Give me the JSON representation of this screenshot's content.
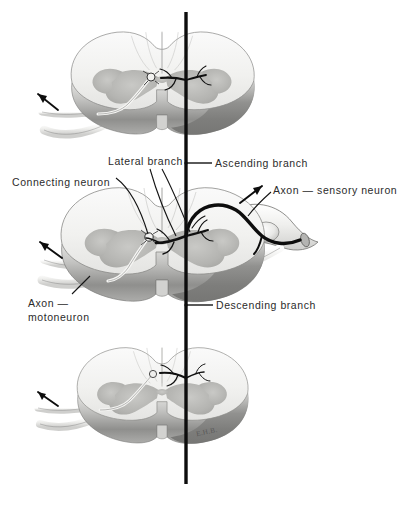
{
  "figure": {
    "width": 404,
    "height": 507,
    "background": "#ffffff",
    "signature": "E.H.B."
  },
  "labels": {
    "connecting_neuron": "Connecting neuron",
    "lateral_branch": "Lateral branch",
    "ascending_branch": "Ascending branch",
    "axon_sensory_neuron": "Axon — sensory neuron",
    "axon_motoneuron_line1": "Axon —",
    "axon_motoneuron_line2": "motoneuron",
    "descending_branch": "Descending branch"
  },
  "colors": {
    "ink": "#2b2b2b",
    "axon_black": "#0d0d0d",
    "cut_face": "#f2f2f0",
    "gray_matter": "#b9b9b7",
    "rim_light": "#dedede",
    "rim_dark": "#8c8c8c",
    "nerve_pale": "#ededeb",
    "nerve_outline": "#6e6e6e",
    "leader_line": "#1a1a1a"
  },
  "sections": [
    {
      "name": "upper-spinal-cord-segment",
      "center_x": 162,
      "center_y": 88,
      "label": "Upper cord segment"
    },
    {
      "name": "middle-spinal-cord-segment",
      "center_x": 162,
      "center_y": 250,
      "label": "Middle cord segment"
    },
    {
      "name": "lower-spinal-cord-segment",
      "center_x": 162,
      "center_y": 400,
      "label": "Lower cord segment"
    }
  ],
  "structures": {
    "vertical_axon": {
      "name": "main-sensory-axon-trunk",
      "x": 186,
      "y_top": 12,
      "y_bottom": 484
    },
    "dorsal_root_ganglion": {
      "name": "dorsal-root-ganglion",
      "x": 268,
      "y": 233
    },
    "nerve_stump": {
      "name": "peripheral-nerve-cut-end",
      "x": 318,
      "y": 243
    },
    "motor_axons": [
      {
        "name": "motor-axon-upper",
        "segment": "upper"
      },
      {
        "name": "motor-axon-middle",
        "segment": "middle"
      },
      {
        "name": "motor-axon-lower",
        "segment": "lower"
      }
    ],
    "direction_arrows": [
      {
        "name": "arrow-upper-motor",
        "x": 44,
        "y": 96,
        "angle": -45
      },
      {
        "name": "arrow-middle-motor",
        "x": 48,
        "y": 248,
        "angle": -45
      },
      {
        "name": "arrow-sensory-in",
        "x": 258,
        "y": 188,
        "angle": -45
      },
      {
        "name": "arrow-lower-motor",
        "x": 45,
        "y": 398,
        "angle": -45
      }
    ]
  }
}
